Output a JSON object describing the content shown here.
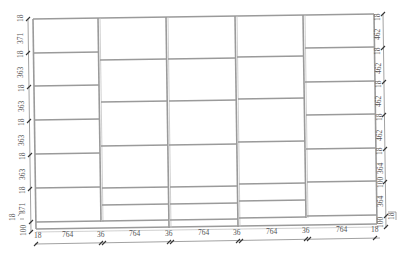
{
  "drawing": {
    "type": "cabinet-front-elevation",
    "line_color": "#9a9a9a",
    "text_color": "#555555",
    "columns": [
      {
        "index": 0,
        "width_label": "764",
        "shelves_y": [
          53,
          86,
          120,
          154,
          188,
          222
        ]
      },
      {
        "index": 1,
        "width_label": "764",
        "shelves_y": [
          60,
          102,
          146,
          188,
          205,
          222
        ]
      },
      {
        "index": 2,
        "width_label": "764",
        "shelves_y": [
          60,
          102,
          146,
          188,
          205,
          222
        ]
      },
      {
        "index": 3,
        "width_label": "764",
        "shelves_y": [
          56,
          98,
          141,
          183,
          200,
          218
        ]
      },
      {
        "index": 4,
        "width_label": "764",
        "shelves_y": [
          49,
          81,
          114,
          147,
          180,
          214
        ]
      }
    ],
    "left_dimensions": [
      "18",
      "371",
      "18",
      "363",
      "18",
      "363",
      "18",
      "363",
      "18",
      "363",
      "18",
      "371",
      "18",
      "100"
    ],
    "left_offset_label": "18",
    "right_dimensions": [
      "18",
      "462",
      "18",
      "462",
      "18",
      "462",
      "18",
      "462",
      "18",
      "364",
      "100"
    ],
    "right_offset_label": "18",
    "bottom_dimensions": [
      "18",
      "764",
      "36",
      "764",
      "36",
      "764",
      "36",
      "764",
      "36",
      "764",
      "18"
    ]
  }
}
